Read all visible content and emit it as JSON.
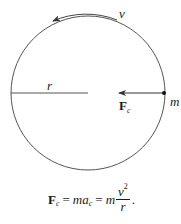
{
  "diagram": {
    "colors": {
      "stroke": "#555555",
      "text": "#1a1a1a",
      "background": "#ffffff"
    },
    "circle": {
      "cx": 88,
      "cy": 93,
      "r": 77
    },
    "labels": {
      "velocity": "v",
      "radius": "r",
      "mass": "m",
      "force_main": "F",
      "force_sub": "c"
    },
    "arrows": {
      "velocity": {
        "direction": "counterclockwise",
        "description": "tangential velocity arc above circle"
      },
      "force": {
        "direction": "toward center",
        "description": "centripetal force on mass at right"
      }
    },
    "formula": {
      "lhs_main": "F",
      "lhs_sub": "c",
      "eq1": "=",
      "mid_m": "m",
      "mid_a": "a",
      "mid_sub": "c",
      "eq2": "=",
      "rhs_m": "m",
      "num_v": "v",
      "num_exp": "2",
      "den": "r",
      "end": "."
    }
  }
}
